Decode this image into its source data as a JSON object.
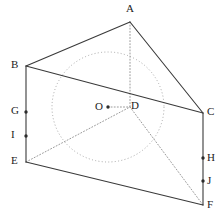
{
  "figure": {
    "stroke_color_visible": "#3a3a3a",
    "stroke_color_hidden": "#9a9a9a",
    "circle_color": "#a8a8a8",
    "background": "#ffffff",
    "labels": [
      {
        "id": "A",
        "text": "A",
        "x": 126,
        "y": 3
      },
      {
        "id": "B",
        "text": "B",
        "x": 11,
        "y": 59
      },
      {
        "id": "C",
        "text": "C",
        "x": 207,
        "y": 106
      },
      {
        "id": "D",
        "text": "D",
        "x": 131,
        "y": 100
      },
      {
        "id": "E",
        "text": "E",
        "x": 11,
        "y": 155
      },
      {
        "id": "F",
        "text": "F",
        "x": 207,
        "y": 199
      },
      {
        "id": "G",
        "text": "G",
        "x": 11,
        "y": 105
      },
      {
        "id": "H",
        "text": "H",
        "x": 207,
        "y": 152
      },
      {
        "id": "I",
        "text": "I",
        "x": 11,
        "y": 129
      },
      {
        "id": "J",
        "text": "J",
        "x": 207,
        "y": 175
      },
      {
        "id": "O",
        "text": "O",
        "x": 95,
        "y": 101
      }
    ],
    "vertices": {
      "A": {
        "x": 130,
        "y": 22
      },
      "B": {
        "x": 26,
        "y": 66
      },
      "C": {
        "x": 203,
        "y": 113
      },
      "D": {
        "x": 130,
        "y": 107
      },
      "E": {
        "x": 26,
        "y": 162
      },
      "F": {
        "x": 203,
        "y": 205
      },
      "G": {
        "x": 26,
        "y": 112
      },
      "H": {
        "x": 203,
        "y": 158
      },
      "I": {
        "x": 26,
        "y": 136
      },
      "J": {
        "x": 203,
        "y": 181
      },
      "O": {
        "x": 108,
        "y": 107
      }
    },
    "marked_dots": [
      "O",
      "G",
      "I",
      "H",
      "J"
    ],
    "solid_edges": [
      {
        "name": "edge-A-B",
        "from": "A",
        "to": "B"
      },
      {
        "name": "edge-A-C",
        "from": "A",
        "to": "C"
      },
      {
        "name": "edge-B-C",
        "from": "B",
        "to": "C"
      },
      {
        "name": "edge-B-E",
        "from": "B",
        "to": "E"
      },
      {
        "name": "edge-E-F",
        "from": "E",
        "to": "F"
      },
      {
        "name": "edge-C-F",
        "from": "C",
        "to": "F"
      }
    ],
    "hidden_edges": [
      {
        "name": "edge-A-D",
        "from": "A",
        "to": "D"
      },
      {
        "name": "edge-E-D",
        "from": "E",
        "to": "D"
      },
      {
        "name": "edge-D-F",
        "from": "D",
        "to": "F"
      },
      {
        "name": "edge-O-D",
        "from": "O",
        "to": "D"
      }
    ],
    "inscribed_circle": {
      "name": "inscribed-circle",
      "center": "O",
      "cx": 108,
      "cy": 107,
      "rx": 56,
      "ry": 55
    }
  }
}
